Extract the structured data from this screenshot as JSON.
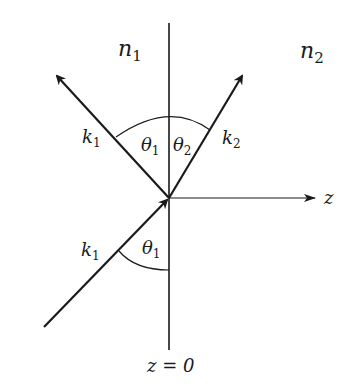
{
  "diagram": {
    "colors": {
      "line": "#1a1a1a",
      "background": "#ffffff"
    },
    "media": [
      {
        "id": "n1",
        "symbol": "n",
        "subscript": "1"
      },
      {
        "id": "n2",
        "symbol": "n",
        "subscript": "2"
      }
    ],
    "axis": {
      "label": "z"
    },
    "interface": {
      "label": "z = 0"
    },
    "rays": {
      "incident": {
        "symbol": "k",
        "subscript": "1"
      },
      "reflected": {
        "symbol": "k",
        "subscript": "1"
      },
      "transmitted": {
        "symbol": "k",
        "subscript": "2"
      }
    },
    "angles": {
      "incident": {
        "symbol": "θ",
        "subscript": "1"
      },
      "reflected": {
        "symbol": "θ",
        "subscript": "1"
      },
      "transmitted": {
        "symbol": "θ",
        "subscript": "2"
      }
    }
  }
}
